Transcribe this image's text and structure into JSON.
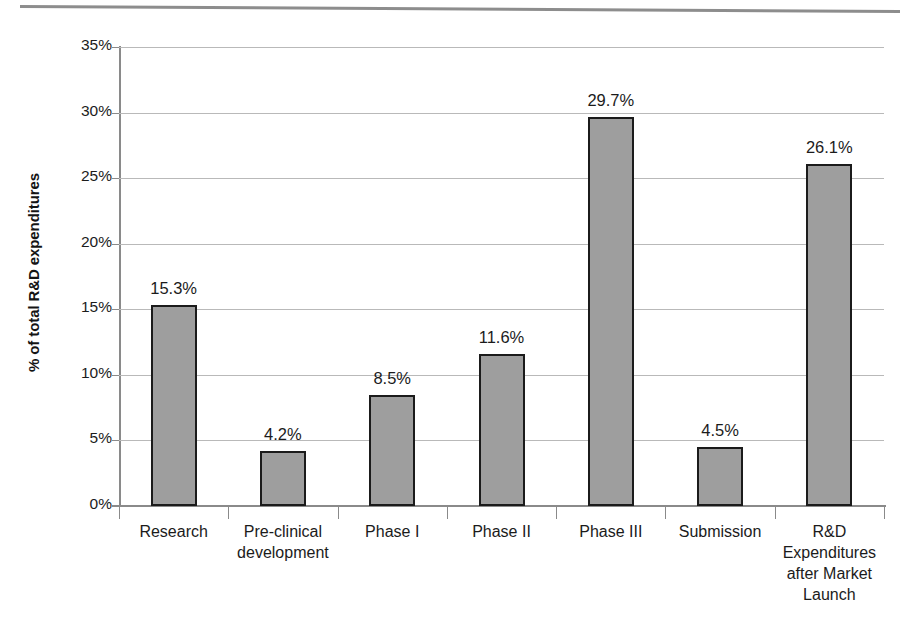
{
  "chart_data": {
    "type": "bar",
    "title": "",
    "subtitle": "",
    "xlabel": "",
    "ylabel": "% of total R&D expenditures",
    "ylim": [
      0,
      35
    ],
    "ytick_labels": [
      "0%",
      "5%",
      "10%",
      "15%",
      "20%",
      "25%",
      "30%",
      "35%"
    ],
    "ytick_values": [
      0,
      5,
      10,
      15,
      20,
      25,
      30,
      35
    ],
    "grid": true,
    "legend": null,
    "value_suffix": "%",
    "categories": [
      "Research",
      "Pre-clinical development",
      "Phase I",
      "Phase II",
      "Phase III",
      "Submission",
      "R&D Expenditures after Market Launch"
    ],
    "category_label_lines": [
      [
        "Research"
      ],
      [
        "Pre-clinical",
        "development"
      ],
      [
        "Phase I"
      ],
      [
        "Phase II"
      ],
      [
        "Phase III"
      ],
      [
        "Submission"
      ],
      [
        "R&D",
        "Expenditures",
        "after Market",
        "Launch"
      ]
    ],
    "values": [
      15.3,
      4.2,
      8.5,
      11.6,
      29.7,
      4.5,
      26.1
    ],
    "data_labels": [
      "15.3%",
      "4.2%",
      "8.5%",
      "11.6%",
      "29.7%",
      "4.5%",
      "26.1%"
    ],
    "colors": {
      "bar_fill": "#9e9e9e",
      "bar_border": "#1b1b1b",
      "gridline": "#b9b9b9",
      "axis_line": "#8a8a8a",
      "text": "#1b1b1b",
      "top_rule": "#8d8d8d"
    }
  },
  "axis": {
    "y_title": "% of total R&D expenditures"
  }
}
